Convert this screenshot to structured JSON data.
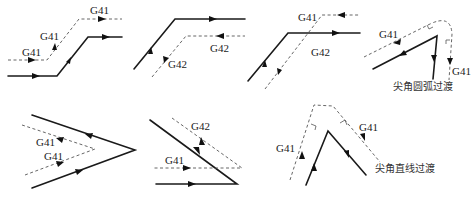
{
  "diagram": {
    "colors": {
      "solid": "#1a1a1a",
      "dashed": "#555555",
      "text": "#222222"
    },
    "panels": [
      {
        "id": "p1",
        "labels": [
          "G41",
          "G41",
          "G41"
        ]
      },
      {
        "id": "p2",
        "labels": [
          "G42",
          "G42"
        ]
      },
      {
        "id": "p3",
        "labels": [
          "G41",
          "G42"
        ]
      },
      {
        "id": "p4",
        "labels": [
          "G41",
          "G41"
        ],
        "caption": "尖角圆弧过渡"
      },
      {
        "id": "p5",
        "labels": [
          "G41",
          "G41"
        ]
      },
      {
        "id": "p6",
        "labels": [
          "G42",
          "G41"
        ]
      },
      {
        "id": "p7",
        "labels": [
          "G41",
          "G41"
        ],
        "caption": "尖角直线过渡"
      }
    ]
  }
}
